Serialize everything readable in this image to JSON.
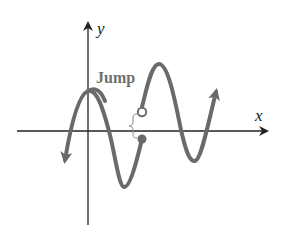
{
  "diagram": {
    "axes": {
      "x_label": "x",
      "y_label": "y"
    },
    "annotation": {
      "label": "Jump"
    },
    "curve": {
      "description": "Sinusoidal curve with a jump discontinuity: left piece ends at a filled (closed) point just below the x-axis; right piece begins at an open circle just above the x-axis.",
      "left_piece_end": "filled-dot",
      "right_piece_start": "open-circle",
      "both_ends": "arrows"
    },
    "colors": {
      "curve": "#6a6a6a",
      "axes": "#222222",
      "label": "#6f6f6f",
      "background": "#ffffff"
    }
  }
}
